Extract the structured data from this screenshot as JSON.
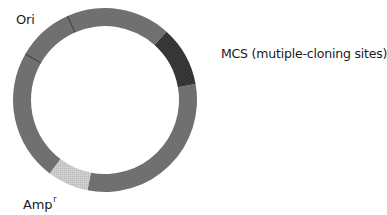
{
  "diagram": {
    "type": "plasmid-map",
    "center": [
      105,
      100
    ],
    "outer_radius": 92,
    "inner_radius": 74,
    "colors": {
      "backbone": "#707070",
      "mcs": "#333333",
      "amp": "#c8c8c8",
      "separator": "#2a2a2a",
      "text": "#1a1a1a"
    },
    "segments": [
      {
        "name": "backbone-main",
        "start_deg": 80,
        "end_deg": 191,
        "color": "#707070"
      },
      {
        "name": "amp-resistance",
        "start_deg": 191,
        "end_deg": 217,
        "color": "#c8c8c8",
        "pattern": "stipple"
      },
      {
        "name": "backbone-left",
        "start_deg": 217,
        "end_deg": 300,
        "color": "#707070"
      },
      {
        "name": "ori",
        "start_deg": 300,
        "end_deg": 336,
        "color": "#707070"
      },
      {
        "name": "backbone-top",
        "start_deg": 336,
        "end_deg": 402,
        "color": "#707070"
      },
      {
        "name": "mcs",
        "start_deg": 42,
        "end_deg": 80,
        "color": "#333333",
        "pattern": "hatched"
      }
    ],
    "separators_deg": [
      300,
      336
    ]
  },
  "labels": {
    "ori": "Ori",
    "mcs": "MCS (mutiple-cloning sites)",
    "amp": "Amp",
    "amp_superscript": "r"
  }
}
